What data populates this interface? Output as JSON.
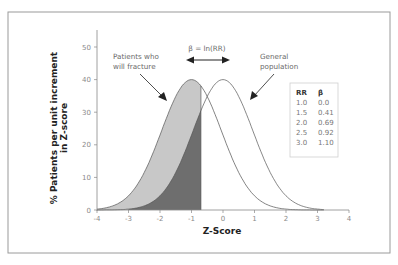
{
  "chart_data": {
    "type": "area",
    "title": "",
    "xlabel": "Z-Score",
    "ylabel": "% Patients per unit increment in Z-score",
    "xlim": [
      -4,
      4
    ],
    "ylim": [
      0,
      50
    ],
    "x_ticks": [
      "-4",
      "-3",
      "-2",
      "-1",
      "0",
      "1",
      "2",
      "3",
      "4"
    ],
    "y_ticks": [
      "0",
      "10",
      "20",
      "30",
      "40",
      "50"
    ],
    "grid": false,
    "series": [
      {
        "name": "Patients who will fracture",
        "distribution": "normal",
        "mean": -1.0,
        "peak": 40,
        "fill": "#c8c8c8"
      },
      {
        "name": "General population",
        "distribution": "normal",
        "mean": 0.0,
        "peak": 40,
        "fill": "none"
      }
    ],
    "shaded_region": {
      "description": "Fracture patients below threshold",
      "x_max": -0.7,
      "fill": "#6e6e6e"
    },
    "annotations": [
      {
        "text": "Patients who will fracture",
        "arrow_to": "fracture curve"
      },
      {
        "text": "General population",
        "arrow_to": "general curve"
      },
      {
        "text": "β = ln(RR)",
        "type": "double-arrow",
        "between_means": [
          -1,
          0
        ]
      }
    ],
    "table": {
      "headers": [
        "RR",
        "β"
      ],
      "rows": [
        [
          "1.0",
          "0.0"
        ],
        [
          "1.5",
          "0.41"
        ],
        [
          "2.0",
          "0.69"
        ],
        [
          "2.5",
          "0.92"
        ],
        [
          "3.0",
          "1.10"
        ]
      ]
    }
  },
  "labels": {
    "fracture": [
      "Patients who",
      "will fracture"
    ],
    "general": [
      "General",
      "population"
    ],
    "beta": "β = ln(RR)",
    "ylabel1": "% Patients per unit increment",
    "ylabel2": "in Z-score",
    "xlabel": "Z-Score"
  }
}
